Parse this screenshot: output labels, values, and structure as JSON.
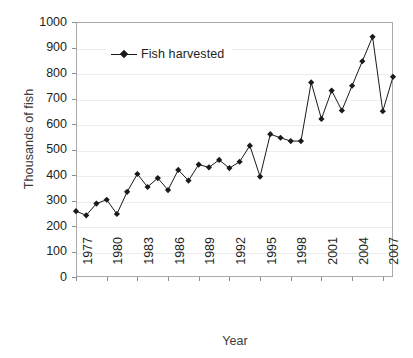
{
  "chart_data": {
    "type": "line",
    "title": "",
    "xlabel": "Year",
    "ylabel": "Thousands of fish",
    "ylim": [
      0,
      1000
    ],
    "ytick_step": 100,
    "yticks": [
      0,
      100,
      200,
      300,
      400,
      500,
      600,
      700,
      800,
      900,
      1000
    ],
    "ytick_labels": [
      "0",
      "100",
      "200",
      "300",
      "400",
      "500",
      "600",
      "700",
      "800",
      "900",
      "1000"
    ],
    "xlim": [
      1977,
      2008
    ],
    "xticks": [
      1977,
      1980,
      1983,
      1986,
      1989,
      1992,
      1995,
      1998,
      2001,
      2004,
      2007
    ],
    "xtick_labels": [
      "1977",
      "1980",
      "1983",
      "1986",
      "1989",
      "1992",
      "1995",
      "1998",
      "2001",
      "2004",
      "2007"
    ],
    "grid": true,
    "grid_axis": "y",
    "legend_position": "upper-left-inside",
    "marker": "diamond",
    "line_color": "#1a1a1a",
    "marker_color": "#1a1a1a",
    "x": [
      1977,
      1978,
      1979,
      1980,
      1981,
      1982,
      1983,
      1984,
      1985,
      1986,
      1987,
      1988,
      1989,
      1990,
      1991,
      1992,
      1993,
      1994,
      1995,
      1996,
      1997,
      1998,
      1999,
      2000,
      2001,
      2002,
      2003,
      2004,
      2005,
      2006,
      2007,
      2008
    ],
    "series": [
      {
        "name": "Fish harvested",
        "values": [
          258,
          242,
          288,
          303,
          247,
          334,
          404,
          353,
          388,
          341,
          420,
          378,
          441,
          430,
          459,
          427,
          452,
          515,
          394,
          560,
          546,
          533,
          533,
          763,
          620,
          731,
          653,
          750,
          846,
          942,
          650,
          785
        ]
      }
    ]
  },
  "legend": {
    "entries": [
      {
        "label": "Fish harvested",
        "marker": "diamond",
        "color": "#1a1a1a"
      }
    ]
  },
  "axes": {
    "y_title": "Thousands of fish",
    "x_title": "Year"
  }
}
